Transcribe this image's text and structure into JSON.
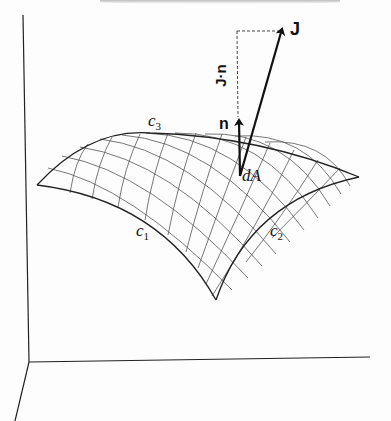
{
  "figure": {
    "labels": {
      "J": "J",
      "J_dot_n": "J·n",
      "n": "n",
      "dA": "dA",
      "c1": "c",
      "c1_sub": "1",
      "c2": "c",
      "c2_sub": "2",
      "c3": "c",
      "c3_sub": "3"
    },
    "elements": {
      "axes": [
        "vertical-axis",
        "horizontal-axis",
        "depth-axis"
      ],
      "surface": "curved mesh patch",
      "vectors": [
        "normal vector n",
        "current density vector J"
      ],
      "projection": "dashed lines showing component J·n"
    },
    "colors": {
      "ink": "#111111",
      "grid": "#555555",
      "background": "#fdfdfd"
    }
  }
}
